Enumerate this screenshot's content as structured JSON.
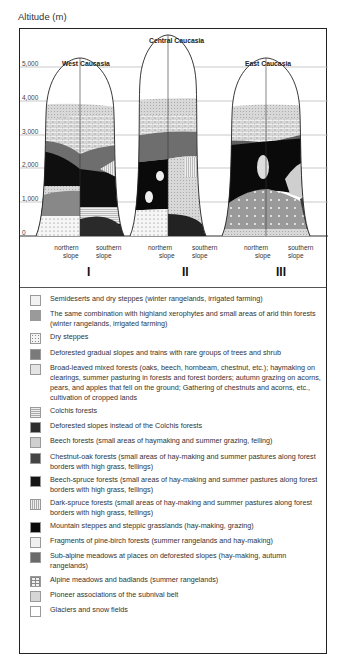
{
  "axis": {
    "ylabel": "Altitude (m)",
    "ticks": [
      "5,000",
      "4,000",
      "3,000",
      "2,000",
      "1,000",
      "0"
    ]
  },
  "regions": [
    {
      "title": "West Caucasia",
      "roman": "I",
      "north": "northern\nslope",
      "north1": "northern",
      "north2": "slope",
      "south1": "southern",
      "south2": "slope"
    },
    {
      "title": "Central Caucasia",
      "roman": "II",
      "north1": "northern",
      "north2": "slope",
      "south1": "southern",
      "south2": "slope"
    },
    {
      "title": "East Caucasia",
      "roman": "III",
      "north1": "northern",
      "north2": "slope",
      "south1": "southern",
      "south2": "slope"
    }
  ],
  "legend": [
    {
      "text": "Semideserts and dry steppes (winter rangelands, irrigated farming)",
      "color": "#f2f2f2"
    },
    {
      "text": "The same combination with highland xerophytes and small areas of arid thin forests (winter rangelands, irrigated farming)",
      "color": "#9a9a9a"
    },
    {
      "text": "Dry steppes",
      "color": "#f4f4f4"
    },
    {
      "text": "Deforested gradual slopes and trains with rare groups of trees and shrub",
      "color": "#7a7a7a"
    },
    {
      "text": "Broad-leaved mixed forests (oaks, beech, hornbeam, chestnut, etc.); haymaking on clearings, summer pasturing in forests and forest borders; autumn grazing on acorns, pears, and apples that fell on the ground; Gathering of chestnuts and acorns, etc., cultivation of cropped lands",
      "color": "#e4e4e4"
    },
    {
      "text": "Colchis forests",
      "color": "#dcdcdc"
    },
    {
      "text": "Deforested slopes instead of the Colchis forests",
      "color": "#2e2e2e"
    },
    {
      "text": "Beech forests (small areas of haymaking and summer grazing, felling)",
      "color": "#cfcfcf"
    },
    {
      "text": "Chestnut-oak forests (small areas of hay-making and summer pastures along forest borders with high grass, fellings)",
      "color": "#454545"
    },
    {
      "text": "Beech-spruce forests (small areas of hay-making and summer pastures along forest borders with high grass, fellings)",
      "color": "#151515"
    },
    {
      "text": "Dark-spruce forests (small areas of hay-making and summer pastures along forest borders with high grass, fellings)",
      "color": "#e8e8e8"
    },
    {
      "text": "Mountain steppes and steppic grasslands (hay-making, grazing)",
      "color": "#0a0a0a"
    },
    {
      "text": "Fragments of pine-birch forests (summer rangelands and hay-making)",
      "color": "#f0f0f0"
    },
    {
      "text": "Sub-alpine meadows at places on deforested slopes (hay-making, autumn rangelands)",
      "color": "#6a6a6a"
    },
    {
      "text": "Alpine meadows and badlands (summer rangelands)",
      "color": "#dadada"
    },
    {
      "text": "Pioneer associations of the subnival belt",
      "color": "#d6d6d6"
    },
    {
      "text": "Glaciers and snow fields",
      "color": "#ffffff"
    }
  ]
}
